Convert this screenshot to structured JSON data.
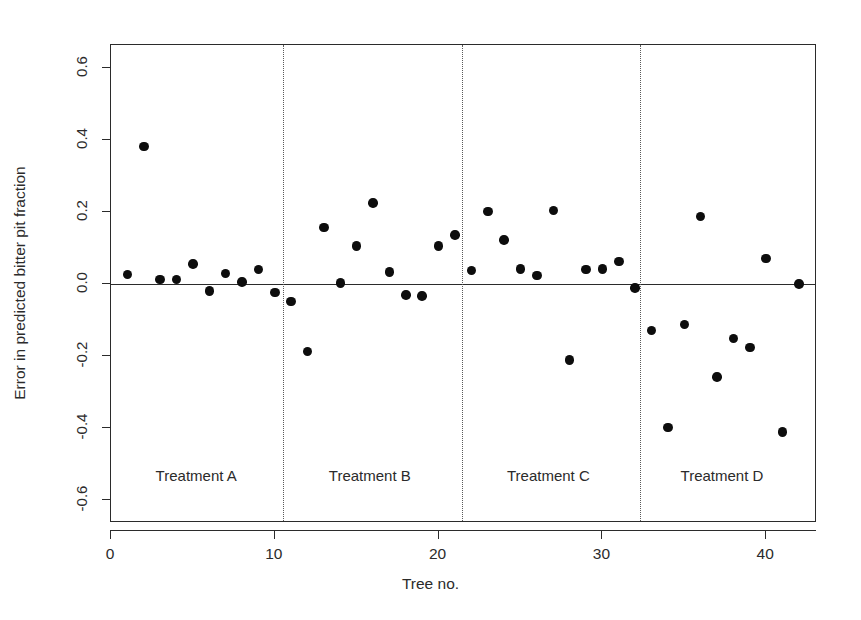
{
  "chart_data": {
    "type": "scatter",
    "title": "",
    "xlabel": "Tree no.",
    "ylabel": "Error in predicted bitter pit fraction",
    "xlim": [
      0,
      43.1
    ],
    "ylim": [
      -0.665,
      0.665
    ],
    "xticks": [
      0,
      10,
      20,
      30,
      40
    ],
    "xticklabels": [
      "0",
      "10",
      "20",
      "30",
      "40"
    ],
    "yticks": [
      0.6,
      0.4,
      0.2,
      0.0,
      -0.2,
      -0.4,
      -0.6
    ],
    "yticklabels": [
      "0.6",
      "0.4",
      "0.2",
      "0.0",
      "-0.2",
      "-0.4",
      "-0.6"
    ],
    "grid": false,
    "legend": "none",
    "reference_lines": [
      {
        "name": "zero-line",
        "orientation": "horizontal",
        "value": 0.0,
        "style": "solid"
      },
      {
        "name": "group-divider-1",
        "orientation": "vertical",
        "value": 10.5,
        "style": "dotted"
      },
      {
        "name": "group-divider-2",
        "orientation": "vertical",
        "value": 21.4,
        "style": "dotted"
      },
      {
        "name": "group-divider-3",
        "orientation": "vertical",
        "value": 32.3,
        "style": "dotted"
      }
    ],
    "annotations": [
      {
        "text": "Treatment A",
        "x": 5.2,
        "y": -0.535
      },
      {
        "text": "Treatment B",
        "x": 15.8,
        "y": -0.535
      },
      {
        "text": "Treatment C",
        "x": 26.7,
        "y": -0.535
      },
      {
        "text": "Treatment D",
        "x": 37.3,
        "y": -0.535
      }
    ],
    "marker": {
      "shape": "circle",
      "color": "#0d0d0d",
      "size": 9.5
    },
    "series": [
      {
        "name": "Error in predicted bitter pit fraction",
        "x": [
          1,
          2,
          3,
          4,
          5,
          6,
          7,
          8,
          9,
          10,
          11,
          12,
          13,
          14,
          15,
          16,
          17,
          18,
          19,
          20,
          21,
          22,
          23,
          24,
          25,
          26,
          27,
          28,
          29,
          30,
          31,
          32,
          33,
          34,
          35,
          36,
          37,
          38,
          39,
          40,
          41,
          42
        ],
        "y": [
          0.026,
          0.382,
          0.013,
          0.012,
          0.056,
          -0.019,
          0.029,
          0.006,
          0.04,
          -0.024,
          -0.048,
          -0.188,
          0.157,
          0.003,
          0.106,
          0.226,
          0.033,
          -0.03,
          -0.033,
          0.106,
          0.136,
          0.038,
          0.202,
          0.122,
          0.042,
          0.023,
          0.205,
          -0.212,
          0.04,
          0.042,
          0.063,
          -0.011,
          -0.13,
          -0.399,
          -0.112,
          0.188,
          -0.259,
          -0.151,
          -0.177,
          0.071,
          -0.412,
          0.0
        ],
        "n_points": 42
      }
    ],
    "groups": [
      {
        "label": "Treatment A",
        "x_range": [
          1,
          10
        ]
      },
      {
        "label": "Treatment B",
        "x_range": [
          11,
          21
        ]
      },
      {
        "label": "Treatment C",
        "x_range": [
          22,
          32
        ]
      },
      {
        "label": "Treatment D",
        "x_range": [
          33,
          42
        ]
      }
    ]
  }
}
